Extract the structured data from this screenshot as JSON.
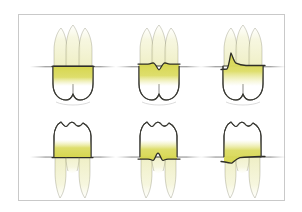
{
  "figure": {
    "background_color": "#ffffff",
    "frame_color": "#c9c9c9",
    "rows": 2,
    "columns": 3
  },
  "palette": {
    "root_fill": "#f3f3d2",
    "root_fill_deep": "#eeeec4",
    "bone_band": "#dbdb5c",
    "bone_band_light": "#e6e68a",
    "crown_fill": "#ffffff",
    "outline": "#3a3a34",
    "bone_line": "#8f8f8f",
    "shadow": "#d8d8d8"
  },
  "panels": [
    {
      "id": "upper-left",
      "position": "top-row-left",
      "arch": "maxillary",
      "tooth": "upper molar",
      "roots": 3,
      "crown_direction": "down",
      "bone_pattern": "horizontal",
      "bone_pattern_label": "Horizontal bone loss",
      "bone_line_shape": "flat",
      "band_color": "#dbdb5c"
    },
    {
      "id": "upper-middle",
      "position": "top-row-middle",
      "arch": "maxillary",
      "tooth": "upper molar",
      "roots": 3,
      "crown_direction": "down",
      "bone_pattern": "interdental crater",
      "bone_pattern_label": "Crater / notched bone loss",
      "bone_line_shape": "v-notch",
      "band_color": "#dbdb5c"
    },
    {
      "id": "upper-right",
      "position": "top-row-right",
      "arch": "maxillary",
      "tooth": "upper molar",
      "roots": 3,
      "crown_direction": "down",
      "bone_pattern": "angular / vertical defect",
      "bone_pattern_label": "Angular (vertical) bone defect",
      "bone_line_shape": "steep-left-slope",
      "band_color": "#dbdb5c"
    },
    {
      "id": "lower-left",
      "position": "bottom-row-left",
      "arch": "mandibular",
      "tooth": "lower molar",
      "roots": 2,
      "crown_direction": "up",
      "bone_pattern": "horizontal",
      "bone_pattern_label": "Horizontal bone loss",
      "bone_line_shape": "flat",
      "band_color": "#dbdb5c"
    },
    {
      "id": "lower-middle",
      "position": "bottom-row-middle",
      "arch": "mandibular",
      "tooth": "lower molar",
      "roots": 2,
      "crown_direction": "up",
      "bone_pattern": "interdental crater",
      "bone_pattern_label": "Crater / notched bone loss",
      "bone_line_shape": "v-notch",
      "band_color": "#dbdb5c"
    },
    {
      "id": "lower-right",
      "position": "bottom-row-right",
      "arch": "mandibular",
      "tooth": "lower molar",
      "roots": 2,
      "crown_direction": "up",
      "bone_pattern": "angular / vertical defect",
      "bone_pattern_label": "Angular (vertical) bone defect",
      "bone_line_shape": "steep-left-slope",
      "band_color": "#dbdb5c"
    }
  ]
}
